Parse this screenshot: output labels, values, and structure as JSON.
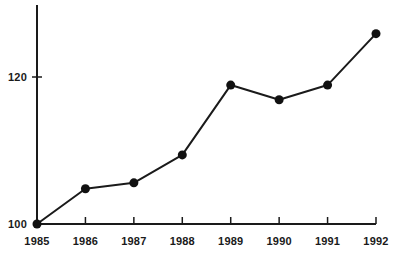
{
  "chart_data": {
    "type": "line",
    "title": "",
    "subtitle": "",
    "xlabel": "",
    "ylabel": "",
    "categories": [
      "1985",
      "1986",
      "1987",
      "1988",
      "1989",
      "1990",
      "1991",
      "1992"
    ],
    "x": [
      1985,
      1986,
      1987,
      1988,
      1989,
      1990,
      1991,
      1992
    ],
    "values": [
      100,
      104.8,
      105.6,
      109.4,
      118.9,
      116.9,
      118.9,
      125.9
    ],
    "series": [
      {
        "name": "index",
        "values": [
          100,
          104.8,
          105.6,
          109.4,
          118.9,
          116.9,
          118.9,
          125.9
        ]
      }
    ],
    "y_tick_labels": [
      "100",
      "120"
    ],
    "y_tick_values": [
      100,
      120
    ],
    "x_tick_labels": [
      "1985",
      "1986",
      "1987",
      "1988",
      "1989",
      "1990",
      "1991",
      "1992"
    ],
    "ylim": [
      100,
      130.5
    ],
    "xlim": [
      1985,
      1992
    ],
    "grid": false,
    "legend": false,
    "legend_position": "none",
    "annotations": [],
    "colors": {
      "line": "#1a1a1a",
      "marker": "#111111",
      "axis": "#1a1a1a",
      "background": "#ffffff",
      "text": "#1a1a1a"
    },
    "marker_style": "circle",
    "line_width": 2,
    "marker_radius": 4.5
  },
  "axes": {
    "y_axis_name": "value-axis",
    "x_axis_name": "year-axis"
  }
}
